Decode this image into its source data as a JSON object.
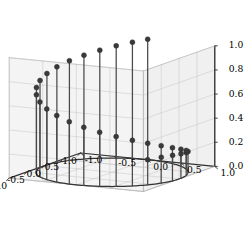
{
  "figure": {
    "title": "",
    "background_color": "#ffffff",
    "width": 252,
    "height": 234
  },
  "chart_data": {
    "type": "scatter",
    "subtype": "stem3d",
    "title": "",
    "xlabel": "",
    "ylabel": "",
    "zlabel": "",
    "projection": "3d",
    "grid": true,
    "legend": null,
    "xlim": [
      -1.0,
      1.0
    ],
    "ylim": [
      -1.0,
      1.0
    ],
    "zlim": [
      0.0,
      1.0
    ],
    "xticks": [
      "-1.0",
      "-0.5",
      "0.0",
      "0.5",
      "1.0"
    ],
    "yticks": [
      "1.0",
      "0.5",
      "0.0",
      "-0.5",
      "-1.0"
    ],
    "zticks": [
      "0.0",
      "0.2",
      "0.4",
      "0.6",
      "0.8",
      "1.0"
    ],
    "xtick_values": [
      -1.0,
      -0.5,
      0.0,
      0.5,
      1.0
    ],
    "ytick_values": [
      1.0,
      0.5,
      0.0,
      -0.5,
      -1.0
    ],
    "ztick_values": [
      0.0,
      0.2,
      0.4,
      0.6,
      0.8,
      1.0
    ],
    "view": {
      "elev": 22,
      "azim": -62
    },
    "marker_color": "#3a3a3a",
    "stem_color": "#4a4a4a",
    "baseline_color": "#333333",
    "pane_color": "#f2f2f2",
    "grid_color": "#c8c8c8",
    "axis_line_color": "#333333",
    "n_points": 30,
    "points": [
      {
        "theta": 0.0,
        "x": 1.0,
        "y": 0.0,
        "z": 0.0
      },
      {
        "theta": 12.41,
        "x": 0.97662,
        "y": 0.21497,
        "z": 0.03448
      },
      {
        "theta": 24.83,
        "x": 0.90757,
        "y": 0.4199,
        "z": 0.06897
      },
      {
        "theta": 37.24,
        "x": 0.79609,
        "y": 0.60518,
        "z": 0.10345
      },
      {
        "theta": 49.66,
        "x": 0.64717,
        "y": 0.76229,
        "z": 0.13793
      },
      {
        "theta": 62.07,
        "x": 0.4684,
        "y": 0.88353,
        "z": 0.17241
      },
      {
        "theta": 74.48,
        "x": 0.26752,
        "y": 0.96355,
        "z": 0.2069
      },
      {
        "theta": 86.9,
        "x": 0.05413,
        "y": 0.99853,
        "z": 0.24138
      },
      {
        "theta": 99.31,
        "x": -0.16166,
        "y": 0.98685,
        "z": 0.27586
      },
      {
        "theta": 111.72,
        "x": -0.36939,
        "y": 0.92926,
        "z": 0.31034
      },
      {
        "theta": 124.14,
        "x": -0.55913,
        "y": 0.82907,
        "z": 0.34483
      },
      {
        "theta": 136.55,
        "x": -0.72463,
        "y": 0.68919,
        "z": 0.37931
      },
      {
        "theta": 148.97,
        "x": -0.85605,
        "y": 0.51687,
        "z": 0.41379
      },
      {
        "theta": 161.38,
        "x": -0.94752,
        "y": 0.31973,
        "z": 0.44828
      },
      {
        "theta": 173.79,
        "x": -0.99384,
        "y": 0.10812,
        "z": 0.48276
      },
      {
        "theta": 186.21,
        "x": -0.99384,
        "y": -0.10812,
        "z": 0.51724
      },
      {
        "theta": 198.62,
        "x": -0.94752,
        "y": -0.31973,
        "z": 0.55172
      },
      {
        "theta": 211.03,
        "x": -0.85605,
        "y": -0.51687,
        "z": 0.58621
      },
      {
        "theta": 223.45,
        "x": -0.72463,
        "y": -0.68919,
        "z": 0.62069
      },
      {
        "theta": 235.86,
        "x": -0.55913,
        "y": -0.82907,
        "z": 0.65517
      },
      {
        "theta": 248.28,
        "x": -0.36939,
        "y": -0.92926,
        "z": 0.68966
      },
      {
        "theta": 260.69,
        "x": -0.16166,
        "y": -0.98685,
        "z": 0.72414
      },
      {
        "theta": 273.1,
        "x": 0.05413,
        "y": -0.99853,
        "z": 0.75862
      },
      {
        "theta": 285.52,
        "x": 0.26752,
        "y": -0.96355,
        "z": 0.7931
      },
      {
        "theta": 297.93,
        "x": 0.4684,
        "y": -0.88353,
        "z": 0.82759
      },
      {
        "theta": 310.34,
        "x": 0.64717,
        "y": -0.76229,
        "z": 0.86207
      },
      {
        "theta": 322.76,
        "x": 0.79609,
        "y": -0.60518,
        "z": 0.89655
      },
      {
        "theta": 335.17,
        "x": 0.90757,
        "y": -0.4199,
        "z": 0.93103
      },
      {
        "theta": 347.59,
        "x": 0.97662,
        "y": -0.21497,
        "z": 0.96552
      },
      {
        "theta": 360.0,
        "x": 1.0,
        "y": 0.0,
        "z": 1.0
      }
    ]
  }
}
